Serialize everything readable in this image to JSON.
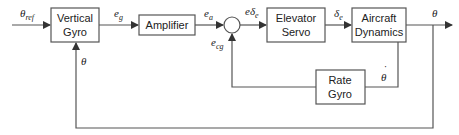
{
  "diagram": {
    "type": "block-diagram",
    "colors": {
      "line": "#555555",
      "text": "#222222",
      "background": "#ffffff"
    },
    "blocks": [
      {
        "id": "vertical_gyro",
        "line1": "Vertical",
        "line2": "Gyro"
      },
      {
        "id": "amplifier",
        "line1": "Amplifier"
      },
      {
        "id": "elevator_servo",
        "line1": "Elevator",
        "line2": "Servo"
      },
      {
        "id": "aircraft_dynamics",
        "line1": "Aircraft",
        "line2": "Dynamics"
      },
      {
        "id": "rate_gyro",
        "line1": "Rate",
        "line2": "Gyro"
      }
    ],
    "summing_junction": {
      "id": "sum1",
      "inputs": [
        "e_a",
        "e_cg"
      ],
      "output": "eδ_e"
    },
    "signals": {
      "theta_ref": {
        "base": "θ",
        "sub": "ref"
      },
      "e_g": {
        "base": "e",
        "sub": "g"
      },
      "e_a": {
        "base": "e",
        "sub": "a"
      },
      "e_delta_e": {
        "base": "eδ",
        "sub": "e"
      },
      "delta_e": {
        "base": "δ",
        "sub": "e"
      },
      "theta_out": {
        "base": "θ"
      },
      "e_cg": {
        "base": "e",
        "sub": "cg"
      },
      "theta_dot": {
        "base": "θ",
        "accent": "˙"
      },
      "theta_fb": {
        "base": "θ"
      }
    }
  }
}
